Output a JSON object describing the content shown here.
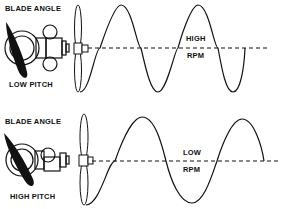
{
  "panels": [
    {
      "id": "low-pitch",
      "blade_angle_label": "BLADE ANGLE",
      "pitch_label": "LOW PITCH",
      "rpm_top_label": "HIGH",
      "rpm_bottom_label": "RPM",
      "wave_description": "shorter wavelength, ~2 full cycles"
    },
    {
      "id": "high-pitch",
      "blade_angle_label": "BLADE ANGLE",
      "pitch_label": "HIGH PITCH",
      "rpm_top_label": "LOW",
      "rpm_bottom_label": "RPM",
      "wave_description": "longer wavelength, ~1.5 cycles"
    }
  ],
  "colors": {
    "ink": "#111111",
    "background": "#ffffff"
  }
}
